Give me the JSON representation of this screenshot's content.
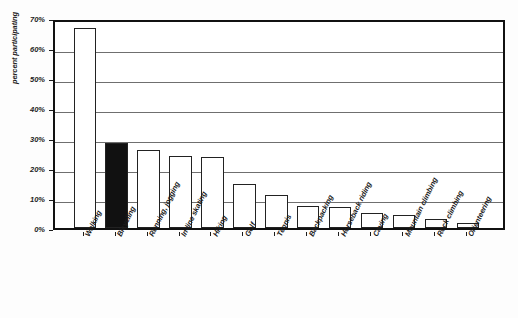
{
  "chart_data": {
    "type": "bar",
    "title": "",
    "xlabel": "",
    "ylabel": "percent participating",
    "categories": [
      "Walking",
      "Bicycling",
      "Running, jogging",
      "In-line skating",
      "Hiking",
      "Golf",
      "Tennis",
      "Backpacking",
      "Horseback riding",
      "Caving",
      "Mountain climbing",
      "Rock climbing",
      "Orienteering"
    ],
    "values": [
      66.7,
      28.5,
      26.0,
      24.0,
      23.7,
      14.7,
      11.0,
      7.5,
      7.0,
      5.0,
      4.5,
      3.0,
      1.8
    ],
    "highlighted_index": 1,
    "highlight_color": "#111111",
    "bar_fill_color": "#ffffff",
    "bar_border_color": "#222222",
    "ylim": [
      0,
      70
    ],
    "ytick_values": [
      0,
      10,
      20,
      30,
      40,
      50,
      60,
      70
    ],
    "ytick_labels": [
      "0%",
      "10%",
      "20%",
      "30%",
      "40%",
      "50%",
      "60%",
      "70%"
    ],
    "grid": true,
    "grid_axis": "y",
    "legend": "none"
  }
}
